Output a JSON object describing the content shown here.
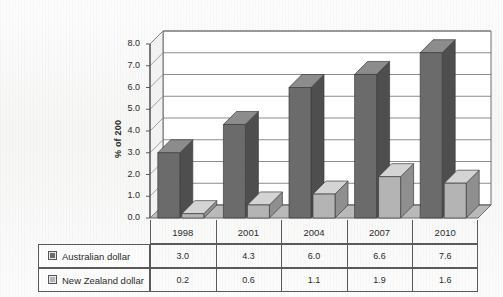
{
  "chart_data": {
    "type": "bar",
    "title": "",
    "subtitle": "",
    "xlabel": "",
    "ylabel": "% of 200",
    "categories": [
      "1998",
      "2001",
      "2004",
      "2007",
      "2010"
    ],
    "series": [
      {
        "name": "Australian dollar",
        "values": [
          3.0,
          4.3,
          6.0,
          6.6,
          7.6
        ],
        "color": "#6b6b6b"
      },
      {
        "name": "New Zealand dollar",
        "values": [
          0.2,
          0.6,
          1.1,
          1.9,
          1.6
        ],
        "color": "#b4b4b4"
      }
    ],
    "ylim": [
      0,
      8
    ],
    "ytick_step": 1,
    "ytick_labels": [
      "0.0",
      "1.0",
      "2.0",
      "3.0",
      "4.0",
      "5.0",
      "6.0",
      "7.0",
      "8.0"
    ],
    "grid": true,
    "legend_position": "bottom-table",
    "three_d": true
  },
  "data_table": {
    "header_row": [
      "",
      "1998",
      "2001",
      "2004",
      "2007",
      "2010"
    ],
    "rows": [
      {
        "label": "Australian dollar",
        "swatch": "dark-swatch-icon",
        "values": [
          "3.0",
          "4.3",
          "6.0",
          "6.6",
          "7.6"
        ]
      },
      {
        "label": "New Zealand dollar",
        "swatch": "light-swatch-icon",
        "values": [
          "0.2",
          "0.6",
          "1.1",
          "1.9",
          "1.6"
        ]
      }
    ]
  },
  "colors": {
    "series_1_front": "#6b6b6b",
    "series_1_top": "#8c8c8c",
    "series_1_side": "#4e4e4e",
    "series_2_front": "#b4b4b4",
    "series_2_top": "#d4d4d4",
    "series_2_side": "#8f8f8f",
    "floor": "#b9b9b9",
    "wall": "#ffffff",
    "grid": "#6f6f6f",
    "table_border": "#5a5a5a",
    "text": "#2b2b2b"
  }
}
